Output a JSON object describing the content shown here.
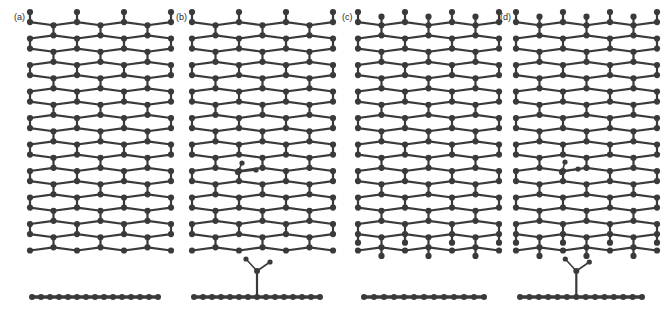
{
  "figure": {
    "type": "molecular-structure-figure",
    "background_color": "#ffffff",
    "atom_color": "#3a3a3a",
    "bond_color": "#3a3a3a",
    "canvas": {
      "width": 665,
      "height": 324
    }
  },
  "panels": [
    {
      "id": "a",
      "label": "(a)",
      "label_x": 14,
      "label_y": 20,
      "top_view": {
        "name": "pristine-lattice-armchair",
        "lattice": "honeycomb",
        "orientation": "pointy-top",
        "x": 30,
        "y": 12,
        "width": 128,
        "height": 243,
        "cols": 6,
        "rows": 9,
        "cell_width": 23.5,
        "cell_height": 26.5,
        "edge_stubs_top": false,
        "edge_stubs_bottom": false,
        "has_adsorbate": false
      },
      "side_view": {
        "name": "flat-sheet-profile",
        "x": 32,
        "y": 297,
        "length": 126,
        "atom_count": 15,
        "has_adsorbate": false
      }
    },
    {
      "id": "b",
      "label": "(b)",
      "label_x": 176,
      "label_y": 20,
      "top_view": {
        "name": "lattice-with-adsorbate-armchair",
        "lattice": "honeycomb",
        "orientation": "pointy-top",
        "x": 192,
        "y": 12,
        "width": 128,
        "height": 243,
        "cols": 6,
        "rows": 9,
        "cell_width": 23.5,
        "cell_height": 26.5,
        "edge_stubs_top": false,
        "edge_stubs_bottom": false,
        "has_adsorbate": true,
        "adsorbate": {
          "name": "adsorbate-group-top-view",
          "site_x": 238,
          "site_y": 172,
          "branches": [
            {
              "dx": 18,
              "dy": -2
            },
            {
              "dx": 4,
              "dy": -9
            }
          ]
        }
      },
      "side_view": {
        "name": "sheet-profile-with-adsorbate",
        "x": 194,
        "y": 297,
        "length": 126,
        "atom_count": 15,
        "has_adsorbate": true,
        "adsorbate": {
          "name": "adsorbate-group-side-view",
          "anchor_index": 7,
          "stem_height": 26,
          "branches": [
            {
              "dx": -11,
              "dy": -12
            },
            {
              "dx": 13,
              "dy": -9
            }
          ]
        }
      }
    },
    {
      "id": "c",
      "label": "(c)",
      "label_x": 342,
      "label_y": 20,
      "top_view": {
        "name": "pristine-lattice-zigzag",
        "lattice": "honeycomb",
        "orientation": "pointy-top",
        "x": 358,
        "y": 12,
        "width": 128,
        "height": 243,
        "cols": 6,
        "rows": 9,
        "cell_width": 23.5,
        "cell_height": 26.5,
        "edge_stubs_top": true,
        "edge_stubs_bottom": true,
        "has_adsorbate": false
      },
      "side_view": {
        "name": "flat-sheet-profile",
        "x": 364,
        "y": 297,
        "length": 120,
        "atom_count": 13,
        "has_adsorbate": false
      }
    },
    {
      "id": "d",
      "label": "(d)",
      "label_x": 500,
      "label_y": 20,
      "top_view": {
        "name": "lattice-with-adsorbate-zigzag",
        "lattice": "honeycomb",
        "orientation": "pointy-top",
        "x": 516,
        "y": 12,
        "width": 128,
        "height": 243,
        "cols": 6,
        "rows": 9,
        "cell_width": 23.5,
        "cell_height": 26.5,
        "edge_stubs_top": true,
        "edge_stubs_bottom": true,
        "has_adsorbate": true,
        "adsorbate": {
          "name": "adsorbate-group-top-view",
          "site_x": 562,
          "site_y": 172,
          "branches": [
            {
              "dx": 16,
              "dy": -3
            },
            {
              "dx": 3,
              "dy": -10
            }
          ]
        }
      },
      "side_view": {
        "name": "sheet-profile-with-adsorbate",
        "x": 520,
        "y": 297,
        "length": 122,
        "atom_count": 14,
        "has_adsorbate": true,
        "adsorbate": {
          "name": "adsorbate-group-side-view",
          "anchor_index": 6,
          "stem_height": 26,
          "branches": [
            {
              "dx": -11,
              "dy": -12
            },
            {
              "dx": 13,
              "dy": -9
            }
          ]
        }
      }
    }
  ],
  "style": {
    "atom_radius_top": 3.1,
    "atom_radius_side": 3.0,
    "atom_radius_adsorbate": 2.6,
    "bond_width_top": 2.2,
    "bond_width_side": 3.4,
    "bond_width_adsorbate": 1.6
  }
}
